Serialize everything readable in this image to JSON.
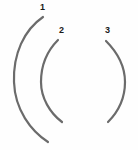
{
  "figure": {
    "width": 138,
    "height": 150,
    "background_color": "#fefefe",
    "stroke_color": "#6b6b6b",
    "stroke_width": 2.2,
    "label_color": "#1a1a1a"
  },
  "arcs": [
    {
      "id": "arc-1",
      "label": "1",
      "label_x": 40,
      "label_y": 3,
      "orientation": "concave-right",
      "path": "M 43 17 C 24 30, 13 54, 14 82 C 15 110, 31 131, 48 142",
      "start_point": [
        43,
        17
      ],
      "extreme_point": [
        14,
        82
      ],
      "end_point": [
        48,
        142
      ]
    },
    {
      "id": "arc-2",
      "label": "2",
      "label_x": 59,
      "label_y": 26,
      "orientation": "concave-right",
      "path": "M 58 40 C 47 51, 41 66, 41 82 C 41 98, 50 113, 62 122",
      "start_point": [
        58,
        40
      ],
      "extreme_point": [
        41,
        82
      ],
      "end_point": [
        62,
        122
      ]
    },
    {
      "id": "arc-3",
      "label": "3",
      "label_x": 105,
      "label_y": 26,
      "orientation": "concave-left",
      "path": "M 106 41 C 117 52, 125 66, 125 82 C 125 98, 118 112, 108 122",
      "start_point": [
        106,
        41
      ],
      "extreme_point": [
        125,
        82
      ],
      "end_point": [
        108,
        122
      ]
    }
  ]
}
